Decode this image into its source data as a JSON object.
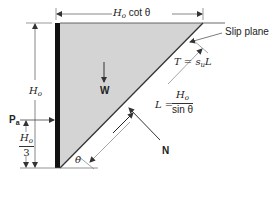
{
  "diagram": {
    "type": "retaining-wall-slip-plane",
    "colors": {
      "wedge_fill": "#d4d4d4",
      "wall": "#111111",
      "lines": "#333333"
    },
    "labels": {
      "top_dimension": "H",
      "top_dimension_sub": "o",
      "top_dimension_suffix": " cot θ",
      "height": "H",
      "height_sub": "o",
      "weight": "W",
      "active_force": "P",
      "active_force_sub": "a",
      "third_num": "H",
      "third_num_sub": "o",
      "third_den": "3",
      "angle": "θ",
      "slip_plane": "Slip plane",
      "shear": "T = s",
      "shear_sub": "u",
      "shear_suffix": "L",
      "length_lhs": "L =",
      "length_num": "H",
      "length_num_sub": "o",
      "length_den": "sin θ",
      "normal": "N"
    }
  }
}
